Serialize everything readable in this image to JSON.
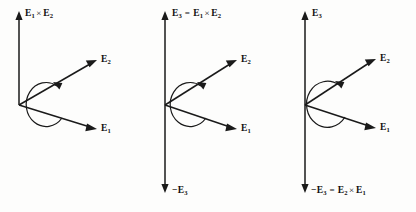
{
  "figure": {
    "background_color": "#fdfdfc",
    "ink_color": "#1a1a1a",
    "width": 416,
    "height": 212,
    "panel_count": 3
  },
  "symbols": {
    "cross": "×",
    "equals": "=",
    "minus": "−",
    "E": "E"
  },
  "panels": [
    {
      "id": "panel-1",
      "name": "cross-product-e1-e2",
      "axis_label": {
        "text": "E₁ × E₂",
        "base_1": "E",
        "sub_1": "1",
        "operator": "×",
        "base_2": "E",
        "sub_2": "2"
      },
      "vectors": [
        {
          "name": "vertical-axis",
          "label_text": "E₁ × E₂",
          "direction": "up",
          "double_headed": false
        },
        {
          "name": "e2-vector",
          "label_text": "E₂",
          "base": "E",
          "sub": "2",
          "direction": "upper-right"
        },
        {
          "name": "e1-vector",
          "label_text": "E₁",
          "base": "E",
          "sub": "1",
          "direction": "lower-right"
        }
      ],
      "arc": {
        "name": "rotation-arc",
        "arrowhead": "top",
        "sense": "counterclockwise"
      }
    },
    {
      "id": "panel-2",
      "name": "e3-equals-e1-cross-e2",
      "top_label": {
        "text": "E₃ = E₁ × E₂",
        "lhs_base": "E",
        "lhs_sub": "3",
        "equals": "=",
        "rhs1_base": "E",
        "rhs1_sub": "1",
        "operator": "×",
        "rhs2_base": "E",
        "rhs2_sub": "2"
      },
      "bottom_label": {
        "text": "−E₃",
        "minus": "−",
        "base": "E",
        "sub": "3"
      },
      "vectors": [
        {
          "name": "vertical-axis",
          "direction": "both",
          "double_headed": true
        },
        {
          "name": "e2-vector",
          "label_text": "E₂",
          "base": "E",
          "sub": "2",
          "direction": "upper-right"
        },
        {
          "name": "e1-vector",
          "label_text": "E₁",
          "base": "E",
          "sub": "1",
          "direction": "lower-right"
        }
      ],
      "arc": {
        "name": "rotation-arc",
        "arrowhead": "top",
        "sense": "counterclockwise"
      }
    },
    {
      "id": "panel-3",
      "name": "minus-e3-equals-e2-cross-e1",
      "top_label": {
        "text": "E₃",
        "base": "E",
        "sub": "3"
      },
      "bottom_label": {
        "text": "−E₃ = E₂ × E₁",
        "minus": "−",
        "lhs_base": "E",
        "lhs_sub": "3",
        "equals": "=",
        "rhs1_base": "E",
        "rhs1_sub": "2",
        "operator": "×",
        "rhs2_base": "E",
        "rhs2_sub": "1"
      },
      "vectors": [
        {
          "name": "vertical-axis",
          "direction": "both",
          "double_headed": true
        },
        {
          "name": "e2-vector",
          "label_text": "E₂",
          "base": "E",
          "sub": "2",
          "direction": "upper-right"
        },
        {
          "name": "e1-vector",
          "label_text": "E₁",
          "base": "E",
          "sub": "1",
          "direction": "lower-right"
        }
      ],
      "arc": {
        "name": "rotation-arc",
        "arrowhead": "top",
        "sense": "counterclockwise"
      }
    }
  ],
  "labels": {
    "p1_axis_base1": "E",
    "p1_axis_sub1": "1",
    "p1_axis_op": "×",
    "p1_axis_base2": "E",
    "p1_axis_sub2": "2",
    "p1_e2_base": "E",
    "p1_e2_sub": "2",
    "p1_e1_base": "E",
    "p1_e1_sub": "1",
    "p2_top_lhs_base": "E",
    "p2_top_lhs_sub": "3",
    "p2_top_eq": "=",
    "p2_top_r1_base": "E",
    "p2_top_r1_sub": "1",
    "p2_top_op": "×",
    "p2_top_r2_base": "E",
    "p2_top_r2_sub": "2",
    "p2_e2_base": "E",
    "p2_e2_sub": "2",
    "p2_e1_base": "E",
    "p2_e1_sub": "1",
    "p2_bot_minus": "−",
    "p2_bot_base": "E",
    "p2_bot_sub": "3",
    "p3_top_base": "E",
    "p3_top_sub": "3",
    "p3_e2_base": "E",
    "p3_e2_sub": "2",
    "p3_e1_base": "E",
    "p3_e1_sub": "1",
    "p3_bot_minus": "−",
    "p3_bot_lhs_base": "E",
    "p3_bot_lhs_sub": "3",
    "p3_bot_eq": "=",
    "p3_bot_r1_base": "E",
    "p3_bot_r1_sub": "2",
    "p3_bot_op": "×",
    "p3_bot_r2_base": "E",
    "p3_bot_r2_sub": "1"
  }
}
